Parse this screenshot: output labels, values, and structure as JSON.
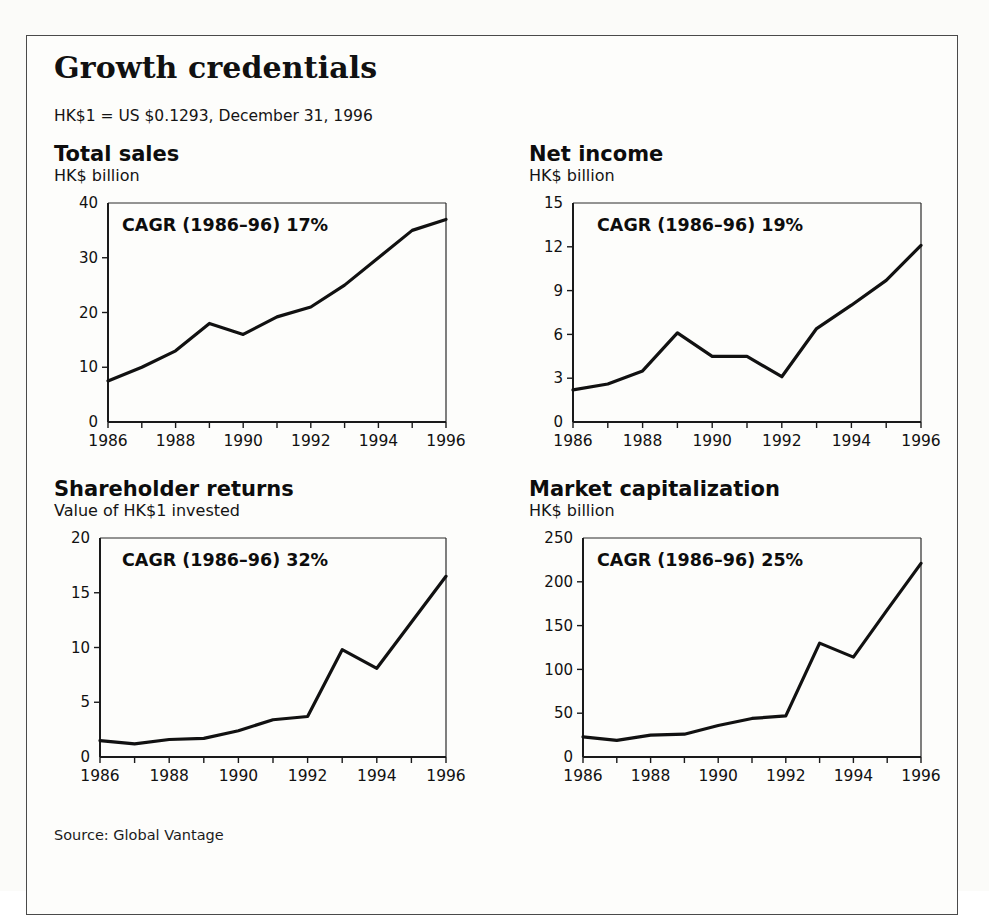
{
  "exhibit": {
    "title": "Growth credentials",
    "note": "HK$1 = US $0.1293, December 31, 1996",
    "source": "Source: Global Vantage"
  },
  "chart_data": [
    {
      "type": "line",
      "title": "Total sales",
      "subtitle": "HK$ billion",
      "ylabel": "HK$ billion",
      "xlabel": "",
      "annotation": "CAGR (1986–96) 17%",
      "cagr_percent": 17,
      "cagr_period": "1986–96",
      "x": [
        1986,
        1987,
        1988,
        1989,
        1990,
        1991,
        1992,
        1993,
        1994,
        1995,
        1996
      ],
      "values": [
        7.5,
        10.0,
        13.0,
        18.0,
        16.0,
        19.2,
        21.0,
        25.0,
        30.0,
        35.0,
        37.0
      ],
      "xticklabels": [
        "1986",
        "",
        "1988",
        "",
        "1990",
        "",
        "1992",
        "",
        "1994",
        "",
        "1996"
      ],
      "yticks": [
        0,
        10,
        20,
        30,
        40
      ],
      "yticklabels": [
        "0",
        "10",
        "20",
        "30",
        "40"
      ],
      "ylim": [
        0,
        40
      ],
      "xlim": [
        1986,
        1996
      ],
      "grid": false,
      "legend": "none"
    },
    {
      "type": "line",
      "title": "Net income",
      "subtitle": "HK$ billion",
      "ylabel": "HK$ billion",
      "xlabel": "",
      "annotation": "CAGR (1986–96) 19%",
      "cagr_percent": 19,
      "cagr_period": "1986–96",
      "x": [
        1986,
        1987,
        1988,
        1989,
        1990,
        1991,
        1992,
        1993,
        1994,
        1995,
        1996
      ],
      "values": [
        2.2,
        2.6,
        3.5,
        6.1,
        4.5,
        4.5,
        3.1,
        6.4,
        8.0,
        9.7,
        12.1
      ],
      "xticklabels": [
        "1986",
        "",
        "1988",
        "",
        "1990",
        "",
        "1992",
        "",
        "1994",
        "",
        "1996"
      ],
      "yticks": [
        0,
        3,
        6,
        9,
        12,
        15
      ],
      "yticklabels": [
        "0",
        "3",
        "6",
        "9",
        "12",
        "15"
      ],
      "ylim": [
        0,
        15
      ],
      "xlim": [
        1986,
        1996
      ],
      "grid": false,
      "legend": "none"
    },
    {
      "type": "line",
      "title": "Shareholder returns",
      "subtitle": "Value of HK$1 invested",
      "ylabel": "Value of HK$1 invested",
      "xlabel": "",
      "annotation": "CAGR (1986–96) 32%",
      "cagr_percent": 32,
      "cagr_period": "1986–96",
      "x": [
        1986,
        1987,
        1988,
        1989,
        1990,
        1991,
        1992,
        1993,
        1994,
        1995,
        1996
      ],
      "values": [
        1.5,
        1.2,
        1.6,
        1.7,
        2.4,
        3.4,
        3.7,
        9.8,
        8.1,
        12.3,
        16.5
      ],
      "xticklabels": [
        "1986",
        "",
        "1988",
        "",
        "1990",
        "",
        "1992",
        "",
        "1994",
        "",
        "1996"
      ],
      "yticks": [
        0,
        5,
        10,
        15,
        20
      ],
      "yticklabels": [
        "0",
        "5",
        "10",
        "15",
        "20"
      ],
      "ylim": [
        0,
        20
      ],
      "xlim": [
        1986,
        1996
      ],
      "grid": false,
      "legend": "none"
    },
    {
      "type": "line",
      "title": "Market capitalization",
      "subtitle": "HK$ billion",
      "ylabel": "HK$ billion",
      "xlabel": "",
      "annotation": "CAGR (1986–96) 25%",
      "cagr_percent": 25,
      "cagr_period": "1986–96",
      "x": [
        1986,
        1987,
        1988,
        1989,
        1990,
        1991,
        1992,
        1993,
        1994,
        1995,
        1996
      ],
      "values": [
        23,
        19,
        25,
        26,
        36,
        44,
        47,
        130,
        114,
        168,
        221
      ],
      "xticklabels": [
        "1986",
        "",
        "1988",
        "",
        "1990",
        "",
        "1992",
        "",
        "1994",
        "",
        "1996"
      ],
      "yticks": [
        0,
        50,
        100,
        150,
        200,
        250
      ],
      "yticklabels": [
        "0",
        "50",
        "100",
        "150",
        "200",
        "250"
      ],
      "ylim": [
        0,
        250
      ],
      "xlim": [
        1986,
        1996
      ],
      "grid": false,
      "legend": "none"
    }
  ],
  "colors": {
    "line": "#111111",
    "axis": "#1a1a1a",
    "frame": "#4a4a4a",
    "text": "#111111",
    "background": "#fdfdfb"
  }
}
